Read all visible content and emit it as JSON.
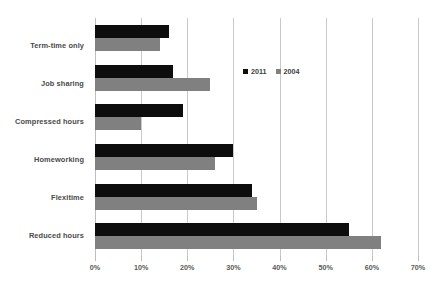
{
  "chart_data": {
    "type": "bar",
    "orientation": "horizontal",
    "title": "",
    "subtitle": "",
    "xlabel": "",
    "ylabel": "",
    "xlim": [
      0,
      70
    ],
    "xtick_labels": [
      "0%",
      "10%",
      "20%",
      "30%",
      "40%",
      "50%",
      "60%",
      "70%"
    ],
    "xticks": [
      0,
      10,
      20,
      30,
      40,
      50,
      60,
      70
    ],
    "grid": true,
    "legend_position": "inside-upper-right",
    "categories": [
      "Term-time only",
      "Job sharing",
      "Compressed hours",
      "Homeworking",
      "Flexitime",
      "Reduced hours"
    ],
    "series": [
      {
        "name": "2011",
        "color": "#0d0d0d",
        "values": [
          16,
          17,
          19,
          30,
          34,
          55
        ]
      },
      {
        "name": "2004",
        "color": "#808080",
        "values": [
          14,
          25,
          10,
          26,
          35,
          62
        ]
      }
    ]
  },
  "legend": {
    "items": [
      {
        "label": "2011",
        "color": "#0d0d0d"
      },
      {
        "label": "2004",
        "color": "#808080"
      }
    ]
  }
}
